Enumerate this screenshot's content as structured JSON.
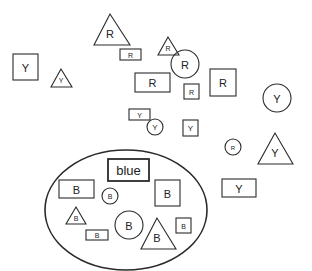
{
  "diagram": {
    "stroke_color": "#2a2a2a",
    "background": "#ffffff",
    "container": {
      "shape": "ellipse",
      "cx": 126,
      "cy": 210,
      "rx": 81,
      "ry": 60,
      "title_label": "blue"
    },
    "shapes": [
      {
        "type": "triangle",
        "label": "R",
        "apex": [
          110,
          14
        ],
        "base_left": [
          94,
          45
        ],
        "base_right": [
          130,
          45
        ],
        "font": 11
      },
      {
        "type": "rect",
        "label": "R",
        "x": 120,
        "y": 49,
        "w": 21,
        "h": 11,
        "font": 7
      },
      {
        "type": "rect",
        "label": "Y",
        "x": 13,
        "y": 54,
        "w": 25,
        "h": 26,
        "font": 11
      },
      {
        "type": "triangle",
        "label": "Y",
        "apex": [
          61,
          69
        ],
        "base_left": [
          51,
          87
        ],
        "base_right": [
          72,
          87
        ],
        "font": 7
      },
      {
        "type": "triangle",
        "label": "R",
        "apex": [
          168,
          37
        ],
        "base_left": [
          158,
          55
        ],
        "base_right": [
          179,
          55
        ],
        "font": 7
      },
      {
        "type": "circle",
        "label": "R",
        "cx": 185,
        "cy": 64,
        "r": 14,
        "font": 11
      },
      {
        "type": "rect",
        "label": "R",
        "x": 135,
        "y": 73,
        "w": 35,
        "h": 19,
        "font": 11
      },
      {
        "type": "rect",
        "label": "R",
        "x": 184,
        "y": 84,
        "w": 15,
        "h": 15,
        "font": 7
      },
      {
        "type": "rect",
        "label": "R",
        "x": 210,
        "y": 69,
        "w": 26,
        "h": 27,
        "font": 11
      },
      {
        "type": "circle",
        "label": "Y",
        "cx": 277,
        "cy": 98,
        "r": 14,
        "font": 11
      },
      {
        "type": "rect",
        "label": "Y",
        "x": 129,
        "y": 109,
        "w": 21,
        "h": 11,
        "font": 7
      },
      {
        "type": "circle",
        "label": "Y",
        "cx": 155,
        "cy": 127,
        "r": 8,
        "font": 8
      },
      {
        "type": "rect",
        "label": "Y",
        "x": 183,
        "y": 120,
        "w": 15,
        "h": 16,
        "font": 8
      },
      {
        "type": "circle",
        "label": "R",
        "cx": 233,
        "cy": 147,
        "r": 8,
        "font": 6
      },
      {
        "type": "triangle",
        "label": "Y",
        "apex": [
          275,
          133
        ],
        "base_left": [
          258,
          164
        ],
        "base_right": [
          293,
          164
        ],
        "font": 11
      },
      {
        "type": "rect",
        "label": "Y",
        "x": 222,
        "y": 179,
        "w": 34,
        "h": 18,
        "font": 11
      }
    ],
    "inner_shapes": [
      {
        "type": "rect",
        "label": "blue",
        "x": 108,
        "y": 159,
        "w": 41,
        "h": 22,
        "font": 13,
        "bold_border": true
      },
      {
        "type": "rect",
        "label": "B",
        "x": 59,
        "y": 180,
        "w": 35,
        "h": 18,
        "font": 11
      },
      {
        "type": "circle",
        "label": "B",
        "cx": 110,
        "cy": 196,
        "r": 8,
        "font": 7
      },
      {
        "type": "rect",
        "label": "B",
        "x": 155,
        "y": 180,
        "w": 25,
        "h": 26,
        "font": 11
      },
      {
        "type": "triangle",
        "label": "B",
        "apex": [
          76,
          207
        ],
        "base_left": [
          66,
          224
        ],
        "base_right": [
          86,
          224
        ],
        "font": 7
      },
      {
        "type": "rect",
        "label": "B",
        "x": 86,
        "y": 230,
        "w": 22,
        "h": 10,
        "font": 7
      },
      {
        "type": "circle",
        "label": "B",
        "cx": 129,
        "cy": 225,
        "r": 14,
        "font": 11
      },
      {
        "type": "triangle",
        "label": "B",
        "apex": [
          157,
          218
        ],
        "base_left": [
          141,
          249
        ],
        "base_right": [
          176,
          249
        ],
        "font": 11
      },
      {
        "type": "rect",
        "label": "B",
        "x": 176,
        "y": 218,
        "w": 15,
        "h": 15,
        "font": 7
      }
    ]
  }
}
